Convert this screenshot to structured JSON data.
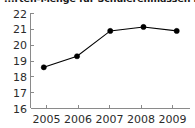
{
  "chart_data": {
    "type": "line",
    "title": "...rten-Menge für Schulerenmassen in Produ...",
    "title_note": "clipped at top edge of image",
    "xlabel": "",
    "ylabel": "",
    "categories": [
      "2005",
      "2006",
      "2007",
      "2008",
      "2009"
    ],
    "x": [
      2005,
      2006,
      2007,
      2008,
      2009
    ],
    "values": [
      18.6,
      19.3,
      20.9,
      21.15,
      20.9
    ],
    "series": [
      {
        "name": "",
        "values": [
          18.6,
          19.3,
          20.9,
          21.15,
          20.9
        ]
      }
    ],
    "ylim": [
      16,
      22
    ],
    "xlim": [
      2004.6,
      2009.4
    ],
    "yticks": [
      16,
      17,
      18,
      19,
      20,
      21,
      22
    ],
    "ytick_labels": [
      "16",
      "17",
      "18",
      "19",
      "20",
      "21",
      "22"
    ],
    "xticks": [
      2005,
      2006,
      2007,
      2008,
      2009
    ],
    "xtick_labels": [
      "2005",
      "2006",
      "2007",
      "2008",
      "2009"
    ],
    "grid": false,
    "legend": null,
    "legend_position": "none",
    "marker": "filled-circle",
    "line_color": "#000000",
    "marker_color": "#000000",
    "axis_color": "#8a8a8a",
    "background_color": "#ffffff",
    "annotations": []
  }
}
